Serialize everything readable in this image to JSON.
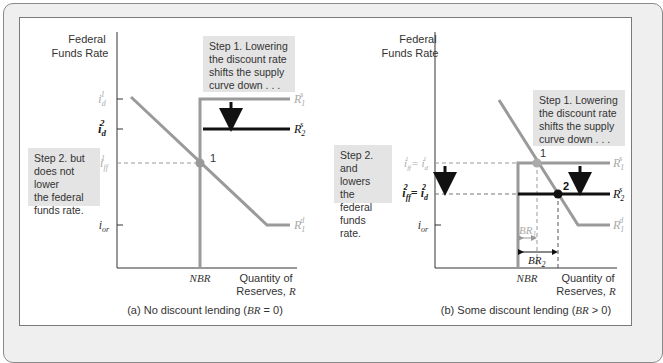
{
  "colors": {
    "curve_gray": "#9a9a9a",
    "curve_black": "#111111",
    "note_bg": "#e4e4e4",
    "frame_bg": "#efefef"
  },
  "panels": [
    {
      "id": "a",
      "y_axis_label": [
        "Federal",
        "Funds Rate"
      ],
      "x_axis_label": [
        "Quantity of",
        "Reserves, R"
      ],
      "nbr_label": "NBR",
      "caption": "(a) No discount lending (BR = 0)",
      "ticks": {
        "id1": "i_d^1",
        "id2": "i_d^2",
        "iff1": "i_ff^1",
        "ior": "i_or"
      },
      "curve_labels": {
        "supply1": "R_1^s",
        "supply2": "R_2^s",
        "demand1": "R_1^d"
      },
      "points": [
        {
          "label": "1"
        }
      ],
      "notes": {
        "step1": [
          "Step 1. Lowering",
          "the discount rate",
          "shifts the supply",
          "curve down . . ."
        ],
        "step2": [
          "Step 2. but",
          "does not lower",
          "the federal",
          "funds rate."
        ]
      }
    },
    {
      "id": "b",
      "y_axis_label": [
        "Federal",
        "Funds Rate"
      ],
      "x_axis_label": [
        "Quantity of",
        "Reserves, R"
      ],
      "nbr_label": "NBR",
      "caption": "(b) Some discount lending (BR > 0)",
      "ticks": {
        "eq1": "i_ff^1 = i_d^1",
        "eq2": "i_ff^2 = i_d^2",
        "ior": "i_or"
      },
      "curve_labels": {
        "supply1": "R_1^s",
        "supply2": "R_2^s",
        "demand1": "R_1^d"
      },
      "points": [
        {
          "label": "1"
        },
        {
          "label": "2"
        }
      ],
      "br_labels": {
        "br1": "BR_1",
        "br2": "BR_2"
      },
      "notes": {
        "step1": [
          "Step 1. Lowering",
          "the discount rate",
          "shifts the supply",
          "curve down . . ."
        ],
        "step2": [
          "Step 2. and",
          "lowers the",
          "federal",
          "funds rate."
        ]
      }
    }
  ]
}
